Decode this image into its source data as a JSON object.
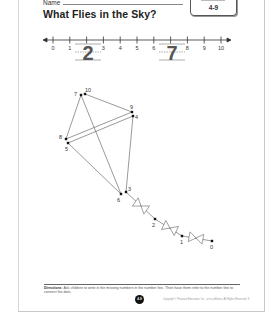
{
  "header": {
    "name_label": "Name",
    "title": "What Flies in the Sky?",
    "badge": {
      "top_text": "",
      "lesson": "4-9"
    }
  },
  "number_line": {
    "ticks": [
      "0",
      "1",
      "2",
      "3",
      "4",
      "5",
      "6",
      "7",
      "8",
      "9",
      "10"
    ],
    "missing_written": [
      {
        "position": 2,
        "value": "2"
      },
      {
        "position": 7,
        "value": "7"
      }
    ]
  },
  "dot_to_dot": {
    "picture": "kite",
    "points": [
      {
        "label": "0",
        "x": 212,
        "y": 241
      },
      {
        "label": "1",
        "x": 182,
        "y": 236
      },
      {
        "label": "2",
        "x": 155,
        "y": 219
      },
      {
        "label": "3",
        "x": 126,
        "y": 192
      },
      {
        "label": "4",
        "x": 133,
        "y": 116
      },
      {
        "label": "5",
        "x": 68,
        "y": 143
      },
      {
        "label": "6",
        "x": 121,
        "y": 194
      },
      {
        "label": "7",
        "x": 81,
        "y": 95
      },
      {
        "label": "8",
        "x": 66,
        "y": 139
      },
      {
        "label": "9",
        "x": 132,
        "y": 112
      },
      {
        "label": "10",
        "x": 85,
        "y": 94
      }
    ]
  },
  "footer": {
    "directions_label": "Directions",
    "directions_text": "Ask children to write in the missing numbers in the number line. Then have them refer to the number line to connect the dots.",
    "page_number": "4-9",
    "copyright": "Copyright © Pearson Education, Inc., or its affiliates. All Rights Reserved. K"
  }
}
